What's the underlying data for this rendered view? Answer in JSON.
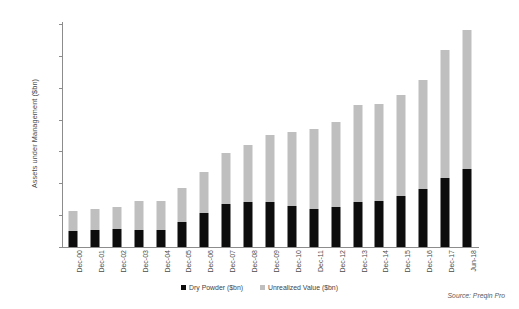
{
  "chart_data": {
    "type": "bar",
    "subtype": "stacked-column",
    "title": "",
    "xlabel": "",
    "ylabel": "Assets under Management ($bn)",
    "ylim": [
      0,
      3500
    ],
    "ytick_labels": [
      "0",
      "500",
      "1,000",
      "1,500",
      "2,000",
      "2,500",
      "3,000",
      "3,500"
    ],
    "ytick_values": [
      0,
      500,
      1000,
      1500,
      2000,
      2500,
      3000,
      3500
    ],
    "grid": false,
    "legend_position": "bottom-center",
    "categories": [
      "Dec-00",
      "Dec-01",
      "Dec-02",
      "Dec-03",
      "Dec-04",
      "Dec-05",
      "Dec-06",
      "Dec-07",
      "Dec-08",
      "Dec-09",
      "Dec-10",
      "Dec-11",
      "Dec-12",
      "Dec-13",
      "Dec-14",
      "Dec-15",
      "Dec-16",
      "Dec-17",
      "Jun-18"
    ],
    "series": [
      {
        "name": "Dry Powder ($bn)",
        "color": "#0d0d0d",
        "values": [
          250,
          260,
          280,
          260,
          260,
          390,
          530,
          680,
          700,
          700,
          640,
          600,
          630,
          710,
          720,
          800,
          910,
          1080,
          1230
        ]
      },
      {
        "name": "Unrealized Value ($bn)",
        "color": "#bfbfbf",
        "values": [
          320,
          330,
          350,
          460,
          470,
          530,
          640,
          800,
          900,
          1060,
          1160,
          1260,
          1330,
          1520,
          1530,
          1590,
          1710,
          2020,
          2170
        ]
      }
    ],
    "totals": [
      570,
      590,
      630,
      720,
      730,
      920,
      1170,
      1480,
      1600,
      1760,
      1800,
      1860,
      1960,
      2230,
      2250,
      2390,
      2620,
      3100,
      3400
    ],
    "source": "Source: Preqin Pro"
  }
}
